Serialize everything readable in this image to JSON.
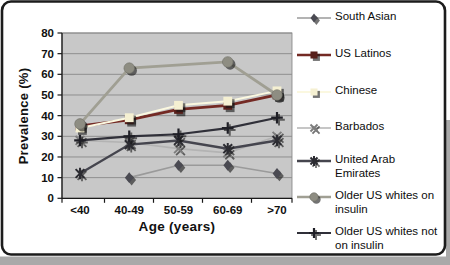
{
  "frame": {
    "background": "#ffffff",
    "border_color": "#1c1c1c",
    "outer_shadow_color": "#a9a9a9",
    "plot_background": "#c8c8c8",
    "gridline_color": "#8f8f8f"
  },
  "chart_data": {
    "type": "line",
    "title": "",
    "xlabel": "Age (years)",
    "ylabel": "Prevalence (%)",
    "categories": [
      "<40",
      "40-49",
      "50-59",
      "60-69",
      ">70"
    ],
    "ylim": [
      0,
      80
    ],
    "yticks": [
      0,
      10,
      20,
      30,
      40,
      50,
      60,
      70,
      80
    ],
    "grid": true,
    "legend_position": "right",
    "series": [
      {
        "name": "South Asian",
        "legend_lines": [
          "South Asian"
        ],
        "values": [
          null,
          10,
          16,
          16,
          12
        ],
        "color": "#9a9a9a",
        "marker": "diamond",
        "marker_color": "#4a4a52",
        "line_width": 1.7
      },
      {
        "name": "US Latinos",
        "legend_lines": [
          "US Latinos"
        ],
        "values": [
          35,
          38,
          43,
          45,
          50
        ],
        "color": "#742a24",
        "marker": "square",
        "marker_color": "#571f1a",
        "line_width": 2.8
      },
      {
        "name": "Chinese",
        "legend_lines": [
          "Chinese"
        ],
        "values": [
          34,
          39,
          45,
          47,
          52
        ],
        "color": "#fbf8e0",
        "marker": "square",
        "marker_color": "#f5f0d2",
        "line_width": 2.0
      },
      {
        "name": "Barbados",
        "legend_lines": [
          "Barbados"
        ],
        "values": [
          28,
          27,
          24,
          22,
          30
        ],
        "color": "#b3b3b3",
        "marker": "x",
        "marker_color": "#7d7d7d",
        "line_width": 1.7
      },
      {
        "name": "United Arab Emirates",
        "legend_lines": [
          "United Arab",
          "Emirates"
        ],
        "values": [
          12,
          26,
          28,
          24,
          28
        ],
        "color": "#45454e",
        "marker": "star",
        "marker_color": "#2c2c32",
        "line_width": 2.4
      },
      {
        "name": "Older US whites on insulin",
        "legend_lines": [
          "Older US whites on",
          "insulin"
        ],
        "values": [
          36,
          63,
          null,
          66,
          50
        ],
        "color": "#a09f93",
        "marker": "circle",
        "marker_color": "#8e8d82",
        "line_width": 2.8
      },
      {
        "name": "Older US whites not on insulin",
        "legend_lines": [
          "Older US whites not",
          "on insulin"
        ],
        "values": [
          28,
          30,
          31,
          34,
          39
        ],
        "color": "#303039",
        "marker": "plus",
        "marker_color": "#1f1f26",
        "line_width": 2.2
      }
    ]
  },
  "legend_row_tops": [
    9,
    46,
    83,
    119,
    152,
    188,
    224
  ]
}
